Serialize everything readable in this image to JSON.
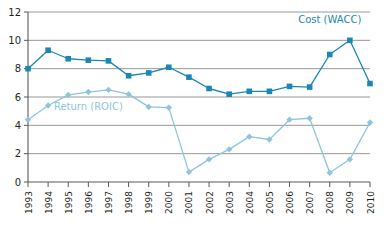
{
  "chart_data": {
    "type": "line",
    "title": "",
    "subtitle": "",
    "xlabel": "",
    "ylabel": "",
    "categories": [
      "1993",
      "1994",
      "1995",
      "1996",
      "1997",
      "1998",
      "1999",
      "2000",
      "2001",
      "2002",
      "2003",
      "2004",
      "2005",
      "2006",
      "2007",
      "2008",
      "2009",
      "2010"
    ],
    "xtick_labels": [
      "1993",
      "1994",
      "1995",
      "1996",
      "1997",
      "1998",
      "1999",
      "2000",
      "2001",
      "2002",
      "2003",
      "2004",
      "2005",
      "2006",
      "2007",
      "2008",
      "2009",
      "2010"
    ],
    "ytick_labels": [
      "0",
      "2",
      "4",
      "6",
      "8",
      "10",
      "12"
    ],
    "ytick_values": [
      0,
      2,
      4,
      6,
      8,
      10,
      12
    ],
    "ylim": [
      0,
      12
    ],
    "grid": "horizontal",
    "legend_position": "inline-annotation",
    "series": [
      {
        "name": "Cost (WACC)",
        "label": "Cost (WACC)",
        "color": "#1b87b5",
        "marker": "square",
        "values": [
          8.0,
          9.3,
          8.7,
          8.6,
          8.55,
          7.5,
          7.7,
          8.1,
          7.4,
          6.6,
          6.2,
          6.4,
          6.4,
          6.75,
          6.7,
          9.0,
          10.0,
          6.95
        ]
      },
      {
        "name": "Return (ROIC)",
        "label": "Return (ROIC)",
        "color": "#8fc4dd",
        "marker": "diamond",
        "values": [
          4.4,
          5.4,
          6.15,
          6.35,
          6.5,
          6.2,
          5.3,
          5.25,
          0.7,
          1.6,
          2.3,
          3.2,
          3.0,
          4.4,
          4.5,
          0.65,
          1.6,
          4.2
        ]
      }
    ],
    "annotations": [
      {
        "name": "cost-label",
        "text": "Cost (WACC)",
        "x": 2008,
        "y": 11.2,
        "color": "#1b87b5"
      },
      {
        "name": "roic-label",
        "text": "Return (ROIC)",
        "x": 1996,
        "y": 5.05,
        "color": "#8fc4dd"
      }
    ]
  },
  "axes": {
    "y_labels": [
      "12",
      "10",
      "8",
      "6",
      "4",
      "2",
      "0"
    ],
    "x_labels": [
      "1993",
      "1994",
      "1995",
      "1996",
      "1997",
      "1998",
      "1999",
      "2000",
      "2001",
      "2002",
      "2003",
      "2004",
      "2005",
      "2006",
      "2007",
      "2008",
      "2009",
      "2010"
    ]
  },
  "labels": {
    "cost_series": "Cost (WACC)",
    "roic_series": "Return (ROIC)"
  },
  "colors": {
    "cost": "#1b87b5",
    "roic": "#8fc4dd",
    "grid": "#8c8c8c",
    "axis": "#58595b",
    "text": "#231f20",
    "background": "#ffffff"
  }
}
